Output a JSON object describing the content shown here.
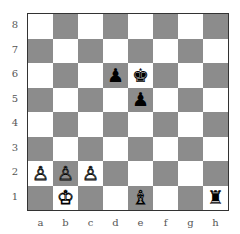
{
  "board": {
    "ranks": [
      "8",
      "7",
      "6",
      "5",
      "4",
      "3",
      "2",
      "1"
    ],
    "files": [
      "a",
      "b",
      "c",
      "d",
      "e",
      "f",
      "g",
      "h"
    ],
    "light_color": "#ffffff",
    "dark_color": "#8c8c8c",
    "pieces": [
      {
        "square": "d6",
        "piece": "pawn",
        "color": "black",
        "glyph": "♟"
      },
      {
        "square": "e6",
        "piece": "king",
        "color": "black",
        "glyph": "♚"
      },
      {
        "square": "e5",
        "piece": "pawn",
        "color": "black",
        "glyph": "♟"
      },
      {
        "square": "a2",
        "piece": "pawn",
        "color": "white",
        "glyph": "♙"
      },
      {
        "square": "b2",
        "piece": "pawn",
        "color": "white",
        "glyph": "♙"
      },
      {
        "square": "c2",
        "piece": "pawn",
        "color": "white",
        "glyph": "♙"
      },
      {
        "square": "b1",
        "piece": "king",
        "color": "white",
        "glyph": "♔"
      },
      {
        "square": "e1",
        "piece": "bishop",
        "color": "white",
        "glyph": "♗"
      },
      {
        "square": "h1",
        "piece": "rook",
        "color": "black",
        "glyph": "♜"
      }
    ]
  }
}
